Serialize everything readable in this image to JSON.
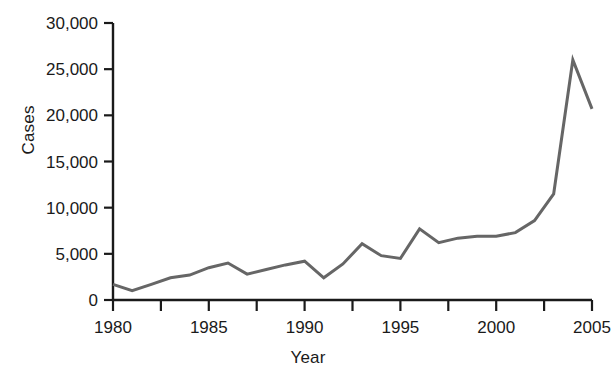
{
  "chart_data": {
    "type": "line",
    "title": "",
    "xlabel": "Year",
    "ylabel": "Cases",
    "xlim": [
      1980,
      2005
    ],
    "ylim": [
      0,
      30000
    ],
    "grid": false,
    "legend": false,
    "line_color": "#666666",
    "axis_color": "#1a1a1a",
    "x_ticks": [
      1980,
      1985,
      1990,
      1995,
      2000,
      2005
    ],
    "x_tick_labels": [
      "1980",
      "1985",
      "1990",
      "1995",
      "2000",
      "2005"
    ],
    "x_minor_ticks": [
      1982.5,
      1987.5,
      1992.5,
      1997.5,
      2002.5
    ],
    "y_ticks": [
      0,
      5000,
      10000,
      15000,
      20000,
      25000,
      30000
    ],
    "y_tick_labels": [
      "0",
      "5,000",
      "10,000",
      "15,000",
      "20,000",
      "25,000",
      "30,000"
    ],
    "x": [
      1980,
      1981,
      1982,
      1983,
      1984,
      1985,
      1986,
      1987,
      1988,
      1989,
      1990,
      1991,
      1992,
      1993,
      1994,
      1995,
      1996,
      1997,
      1998,
      1999,
      2000,
      2001,
      2002,
      2003,
      2004,
      2005
    ],
    "values": [
      1700,
      1000,
      1700,
      2400,
      2700,
      3500,
      4000,
      2800,
      3300,
      3800,
      4200,
      2400,
      3900,
      6100,
      4800,
      4500,
      7700,
      6200,
      6700,
      6900,
      6900,
      7300,
      8600,
      11500,
      26000,
      20700
    ],
    "series": [
      {
        "name": "Cases",
        "values": [
          1700,
          1000,
          1700,
          2400,
          2700,
          3500,
          4000,
          2800,
          3300,
          3800,
          4200,
          2400,
          3900,
          6100,
          4800,
          4500,
          7700,
          6200,
          6700,
          6900,
          6900,
          7300,
          8600,
          11500,
          26000,
          20700
        ]
      }
    ]
  }
}
